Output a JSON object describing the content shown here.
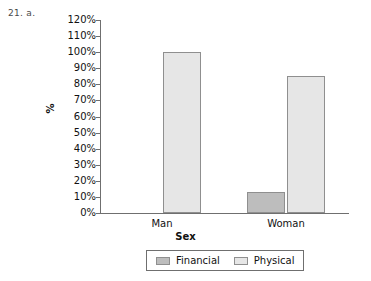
{
  "problem_label": "21.  a.",
  "chart_data": {
    "type": "bar",
    "title": "",
    "xlabel": "Sex",
    "ylabel": "%",
    "categories": [
      "Man",
      "Woman"
    ],
    "series": [
      {
        "name": "Financial",
        "values": [
          0,
          13
        ],
        "color": "#bdbdbd"
      },
      {
        "name": "Physical",
        "values": [
          100,
          85
        ],
        "color": "#e6e6e6"
      }
    ],
    "ylim": [
      0,
      120
    ],
    "ytick_labels": [
      "120%",
      "110%",
      "100%",
      "90%",
      "80%",
      "70%",
      "60%",
      "50%",
      "40%",
      "30%",
      "20%",
      "10%",
      "0%"
    ],
    "ytick_values": [
      120,
      110,
      100,
      90,
      80,
      70,
      60,
      50,
      40,
      30,
      20,
      10,
      0
    ],
    "grid": false,
    "legend_position": "bottom",
    "axis_color": "#6f6f6f",
    "bar_edge_color": "#8f8f8f"
  }
}
